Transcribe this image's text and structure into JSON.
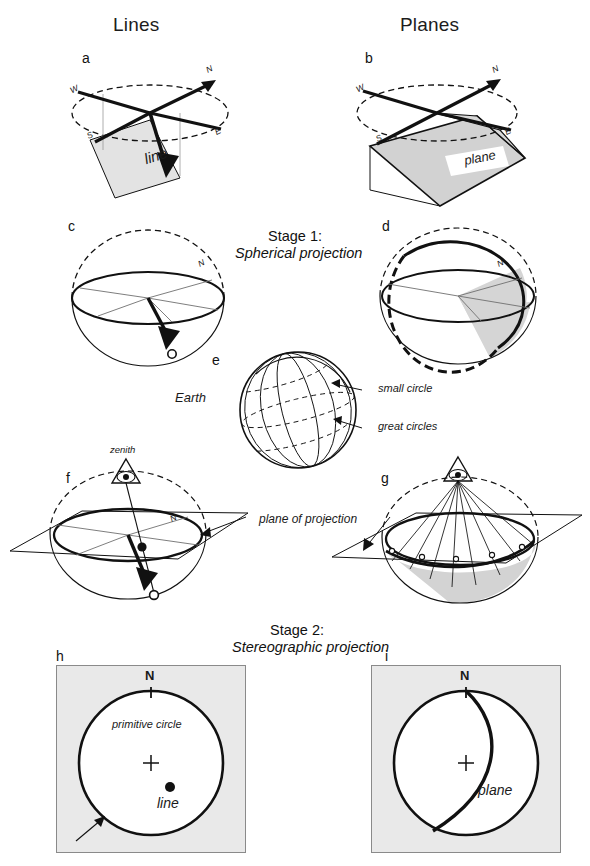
{
  "figure": {
    "title_columns": [
      {
        "id": "lines",
        "label": "Lines"
      },
      {
        "id": "planes",
        "label": "Planes"
      }
    ],
    "stages": [
      {
        "id": "stage1",
        "heading": "Stage 1:",
        "subheading": "Spherical projection"
      },
      {
        "id": "stage2",
        "heading": "Stage 2:",
        "subheading": "Stereographic projection"
      }
    ],
    "panels": [
      {
        "letter": "a",
        "column": "lines",
        "row": 1,
        "caption": "line"
      },
      {
        "letter": "b",
        "column": "planes",
        "row": 1,
        "caption": "plane"
      },
      {
        "letter": "c",
        "column": "lines",
        "row": 2,
        "caption": ""
      },
      {
        "letter": "d",
        "column": "planes",
        "row": 2,
        "caption": ""
      },
      {
        "letter": "e",
        "column": "center",
        "row": 3,
        "caption": "Earth"
      },
      {
        "letter": "f",
        "column": "lines",
        "row": 4,
        "caption": ""
      },
      {
        "letter": "g",
        "column": "planes",
        "row": 4,
        "caption": ""
      },
      {
        "letter": "h",
        "column": "lines",
        "row": 5,
        "caption": ""
      },
      {
        "letter": "i",
        "column": "planes",
        "row": 5,
        "caption": ""
      }
    ],
    "compass": {
      "n": "N",
      "e": "E",
      "s": "S",
      "w": "W"
    },
    "annotations": {
      "line": "line",
      "plane": "plane",
      "earth": "Earth",
      "small_circle": "small  circle",
      "great_circles": "great  circles",
      "zenith": "zenith",
      "plane_of_projection": "plane  of  projection",
      "primitive_circle": "primitive  circle",
      "north": "N"
    },
    "colors": {
      "ink": "#111111",
      "panel_background": "#e9e9e9",
      "panel_border": "#8a8a8a",
      "shaded_plane": "#d0d0d0",
      "shaded_plane_light": "#e0e0e0",
      "page_background": "#ffffff",
      "stereonet_fill": "#ffffff"
    }
  }
}
